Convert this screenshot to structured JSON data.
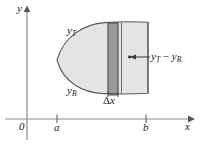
{
  "figure": {
    "axes": {
      "y_axis_label": "y",
      "x_axis_label": "x",
      "origin_label": "0",
      "tick_a_label": "a",
      "tick_b_label": "b"
    },
    "curves": {
      "top_curve_label_base": "y",
      "top_curve_label_sub": "T",
      "bottom_curve_label_base": "y",
      "bottom_curve_label_sub": "B"
    },
    "callouts": {
      "height_label_part1_base": "y",
      "height_label_part1_sub": "T",
      "height_label_operator": " − ",
      "height_label_part2_base": "y",
      "height_label_part2_sub": "B",
      "width_label_greek": "Δ",
      "width_label_var": "x"
    },
    "colors": {
      "region_fill": "#e3e3e3",
      "strip_fill": "#9a9a9a",
      "outline": "#555555",
      "axis": "#808080",
      "text": "#1a1a1a"
    },
    "geometry": {
      "x_axis_y": 119,
      "y_axis_x": 27,
      "tick_a_x": 57,
      "tick_b_x": 146,
      "region_left_x": 57,
      "region_right_x": 148,
      "region_top_y": 22,
      "region_bottom_y": 94,
      "strip_left_x": 108,
      "strip_right_x": 118
    }
  }
}
